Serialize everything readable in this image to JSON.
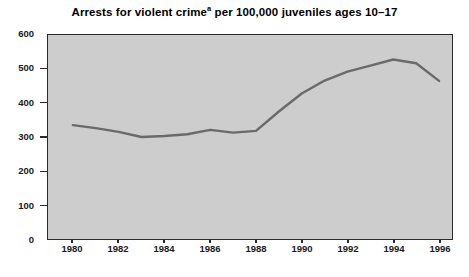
{
  "chart_data": {
    "type": "line",
    "title": "Arrests for violent crime",
    "title_superscript": "a",
    "title_suffix": " per 100,000 juveniles ages 10–17",
    "title_full": "Arrests for violent crimeᵃ per 100,000 juveniles ages 10–17",
    "xlabel": "",
    "ylabel": "",
    "x": [
      1980,
      1981,
      1982,
      1983,
      1984,
      1985,
      1986,
      1987,
      1988,
      1989,
      1990,
      1991,
      1992,
      1993,
      1994,
      1995,
      1996
    ],
    "values": [
      335,
      326,
      315,
      300,
      303,
      308,
      321,
      313,
      318,
      375,
      428,
      466,
      492,
      510,
      528,
      517,
      465
    ],
    "series": [
      {
        "name": "Arrests for violent crime per 100,000 juveniles ages 10-17",
        "values": [
          335,
          326,
          315,
          300,
          303,
          308,
          321,
          313,
          318,
          375,
          428,
          466,
          492,
          510,
          528,
          517,
          465
        ]
      }
    ],
    "xlim": [
      1980,
      1996
    ],
    "ylim": [
      0,
      600
    ],
    "y_ticks": [
      0,
      100,
      200,
      300,
      400,
      500,
      600
    ],
    "y_tick_labels": [
      "0",
      "100",
      "200",
      "300",
      "400",
      "500",
      "600"
    ],
    "x_ticks": [
      1980,
      1982,
      1984,
      1986,
      1988,
      1990,
      1992,
      1994,
      1996
    ],
    "x_tick_labels": [
      "1980",
      "1982",
      "1984",
      "1986",
      "1988",
      "1990",
      "1992",
      "1994",
      "1996"
    ],
    "grid": false,
    "legend": false,
    "legend_position": "none",
    "plot_background_color": "#cdcdcd",
    "line_color": "#6a6a6a",
    "axis_color": "#2b2b2b",
    "page_background_color": "#ffffff"
  }
}
